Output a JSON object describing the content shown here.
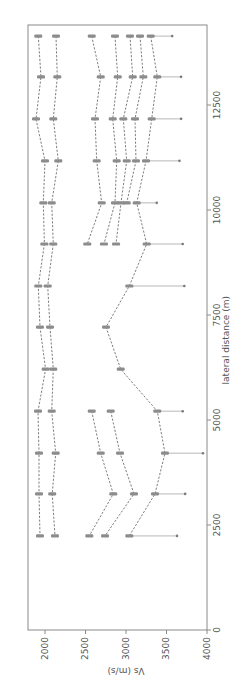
{
  "chart_data": {
    "type": "line",
    "orientation": "rotated-90",
    "title": "",
    "xlabel": "lateral distance (m)",
    "ylabel": "Vs (m/s)",
    "xlim": [
      0,
      14400
    ],
    "ylim": [
      1790,
      4000
    ],
    "x_ticks": [
      0,
      2500,
      5000,
      7500,
      10000,
      12500
    ],
    "x_tick_labels": [
      "0",
      "2500",
      "5000",
      "7500",
      "10000",
      "12500"
    ],
    "y_ticks": [
      2000,
      2500,
      3000,
      3500,
      4000
    ],
    "y_tick_labels": [
      "2000",
      "2500",
      "3000",
      "3500",
      "4000"
    ],
    "grid": false,
    "legend": "none",
    "series": [
      {
        "name": "A",
        "x": [
          14140,
          13170,
          12170,
          11170,
          10170,
          9190,
          8190,
          7210,
          6210,
          5210,
          4210,
          3240,
          2240
        ],
        "values": [
          1917,
          1951,
          1889,
          2000,
          1979,
          1992,
          1917,
          1938,
          2008,
          1914,
          1926,
          1926,
          1938
        ]
      },
      {
        "name": "B",
        "x": [
          14140,
          13170,
          12170,
          11170,
          10170,
          9190,
          8190,
          7210,
          6210,
          5210,
          4210,
          3240,
          2240
        ],
        "values": [
          2136,
          2152,
          2102,
          2164,
          2083,
          2102,
          2033,
          2062,
          2102,
          2083,
          2132,
          2089,
          2123
        ]
      },
      {
        "name": "C",
        "x": [
          14140,
          13170,
          12170,
          11170,
          10170,
          9190
        ],
        "values": [
          2577,
          2688,
          2617,
          2638,
          2700,
          2522
        ]
      },
      {
        "name": "C-south",
        "x": [
          5210,
          4210,
          3240,
          2240
        ],
        "values": [
          2577,
          2688,
          2843,
          2547
        ]
      },
      {
        "name": "D",
        "x": [
          14140,
          13170,
          12170,
          11170,
          10170,
          9190
        ],
        "values": [
          2864,
          2898,
          2836,
          2885,
          2864,
          2728
        ]
      },
      {
        "name": "D-south",
        "x": [
          5210,
          4210,
          3240,
          2240
        ],
        "values": [
          2811,
          2926,
          3099,
          2741
        ]
      },
      {
        "name": "E",
        "x": [
          14140,
          13170,
          12170,
          11170,
          10170,
          9190
        ],
        "values": [
          3049,
          3083,
          2967,
          3009,
          2938,
          2877
        ]
      },
      {
        "name": "F",
        "x": [
          14140,
          13170,
          12170,
          11170,
          10170
        ],
        "values": [
          3173,
          3214,
          3111,
          3123,
          3009
        ]
      },
      {
        "name": "G",
        "x": [
          14140,
          13170,
          12170,
          11170,
          10170,
          9190,
          8190,
          7210,
          6210,
          5210,
          4210,
          3240,
          2240
        ],
        "values": [
          3305,
          3386,
          3317,
          3247,
          3132,
          3256,
          3041,
          2753,
          2935,
          3386,
          3481,
          3358,
          3041
        ]
      }
    ],
    "range_endpoints": [
      {
        "x": 14140,
        "value": 3570
      },
      {
        "x": 13170,
        "value": 3680
      },
      {
        "x": 12170,
        "value": 3680
      },
      {
        "x": 11170,
        "value": 3660
      },
      {
        "x": 10170,
        "value": 3380
      },
      {
        "x": 9190,
        "value": 3700
      },
      {
        "x": 8190,
        "value": 3720
      },
      {
        "x": 5210,
        "value": 3700
      },
      {
        "x": 4210,
        "value": 3950
      },
      {
        "x": 3240,
        "value": 3730
      },
      {
        "x": 2240,
        "value": 3630
      }
    ]
  }
}
